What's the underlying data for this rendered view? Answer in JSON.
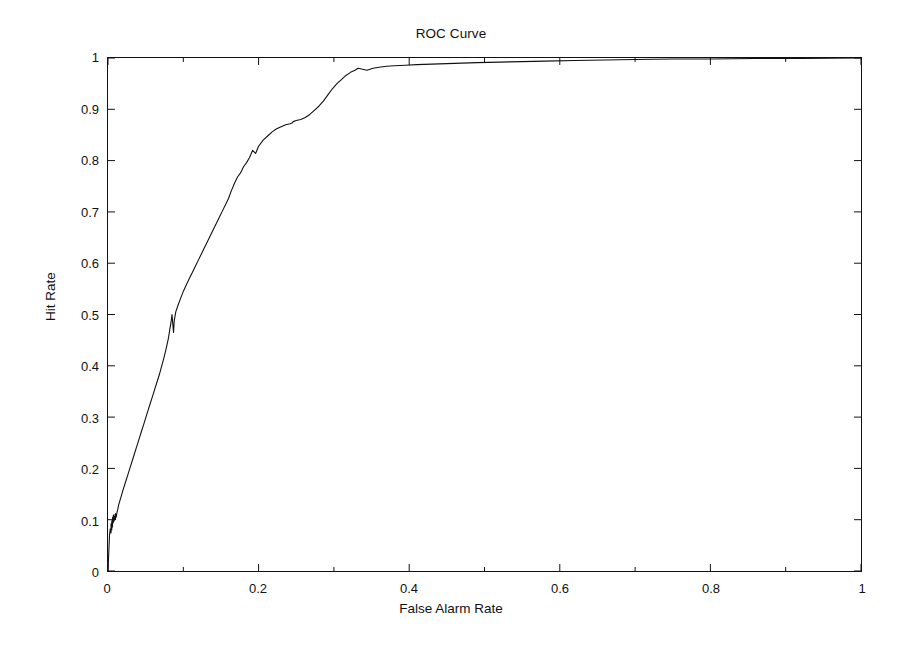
{
  "chart_data": {
    "type": "line",
    "title": "ROC Curve",
    "xlabel": "False Alarm Rate",
    "ylabel": "Hit Rate",
    "xlim": [
      0,
      1
    ],
    "ylim": [
      0,
      1
    ],
    "grid": false,
    "legend": "none",
    "xticks": [
      "0",
      "0.2",
      "0.4",
      "0.6",
      "0.8",
      "1"
    ],
    "xtick_values": [
      0,
      0.2,
      0.4,
      0.6,
      0.8,
      1
    ],
    "yticks": [
      "0",
      "0.1",
      "0.2",
      "0.3",
      "0.4",
      "0.5",
      "0.6",
      "0.7",
      "0.8",
      "0.9",
      "1"
    ],
    "ytick_values": [
      0,
      0.1,
      0.2,
      0.3,
      0.4,
      0.5,
      0.6,
      0.7,
      0.8,
      0.9,
      1
    ],
    "line_color": "#111111",
    "series": [
      {
        "name": "ROC",
        "x": [
          0.0,
          0.002,
          0.003,
          0.004,
          0.004,
          0.005,
          0.005,
          0.006,
          0.006,
          0.006,
          0.007,
          0.007,
          0.008,
          0.008,
          0.009,
          0.01,
          0.01,
          0.011,
          0.012,
          0.013,
          0.014,
          0.016,
          0.018,
          0.02,
          0.023,
          0.026,
          0.029,
          0.032,
          0.035,
          0.038,
          0.041,
          0.044,
          0.047,
          0.05,
          0.053,
          0.056,
          0.059,
          0.062,
          0.065,
          0.068,
          0.071,
          0.074,
          0.077,
          0.08,
          0.082,
          0.084,
          0.085,
          0.086,
          0.087,
          0.088,
          0.09,
          0.093,
          0.096,
          0.1,
          0.104,
          0.108,
          0.112,
          0.116,
          0.12,
          0.124,
          0.128,
          0.132,
          0.136,
          0.14,
          0.144,
          0.148,
          0.152,
          0.156,
          0.16,
          0.164,
          0.168,
          0.172,
          0.176,
          0.18,
          0.184,
          0.188,
          0.192,
          0.196,
          0.2,
          0.206,
          0.212,
          0.218,
          0.224,
          0.23,
          0.236,
          0.242,
          0.245,
          0.246,
          0.25,
          0.256,
          0.262,
          0.268,
          0.274,
          0.28,
          0.286,
          0.292,
          0.298,
          0.304,
          0.31,
          0.316,
          0.322,
          0.328,
          0.332,
          0.338,
          0.344,
          0.352,
          0.36,
          0.37,
          0.38,
          0.395,
          0.41,
          0.43,
          0.45,
          0.47,
          0.49,
          0.52,
          0.55,
          0.58,
          0.62,
          0.66,
          0.7,
          0.75,
          0.8,
          0.86,
          0.92,
          1.0
        ],
        "y": [
          0.0,
          0.07,
          0.082,
          0.074,
          0.092,
          0.08,
          0.098,
          0.086,
          0.104,
          0.09,
          0.108,
          0.094,
          0.11,
          0.097,
          0.106,
          0.1,
          0.112,
          0.105,
          0.115,
          0.12,
          0.128,
          0.138,
          0.148,
          0.158,
          0.172,
          0.186,
          0.2,
          0.214,
          0.228,
          0.242,
          0.256,
          0.27,
          0.284,
          0.298,
          0.312,
          0.326,
          0.34,
          0.354,
          0.368,
          0.382,
          0.398,
          0.414,
          0.432,
          0.452,
          0.47,
          0.488,
          0.5,
          0.482,
          0.465,
          0.488,
          0.505,
          0.518,
          0.53,
          0.545,
          0.558,
          0.57,
          0.582,
          0.594,
          0.606,
          0.618,
          0.63,
          0.642,
          0.654,
          0.666,
          0.678,
          0.69,
          0.702,
          0.714,
          0.726,
          0.742,
          0.756,
          0.768,
          0.776,
          0.788,
          0.796,
          0.806,
          0.82,
          0.814,
          0.828,
          0.84,
          0.848,
          0.856,
          0.862,
          0.866,
          0.87,
          0.872,
          0.874,
          0.876,
          0.878,
          0.88,
          0.884,
          0.89,
          0.898,
          0.906,
          0.916,
          0.928,
          0.94,
          0.95,
          0.958,
          0.966,
          0.972,
          0.976,
          0.98,
          0.978,
          0.976,
          0.98,
          0.982,
          0.984,
          0.985,
          0.986,
          0.987,
          0.988,
          0.989,
          0.99,
          0.991,
          0.992,
          0.993,
          0.994,
          0.995,
          0.996,
          0.997,
          0.998,
          0.998,
          0.999,
          0.999,
          1.0
        ]
      }
    ]
  }
}
